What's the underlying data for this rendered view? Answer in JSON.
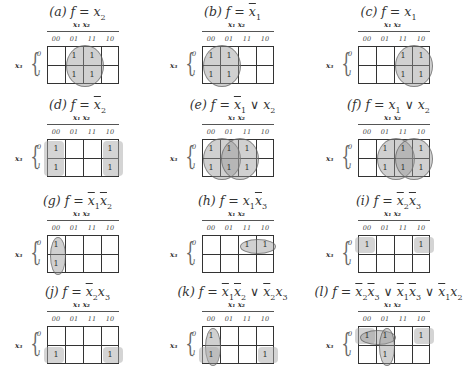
{
  "figure": {
    "column_variables": "x1 x2",
    "row_variable": "x3",
    "column_labels": [
      "00",
      "01",
      "11",
      "10"
    ],
    "row_labels": [
      "0",
      "1"
    ],
    "panels": [
      {
        "id": "a",
        "label": "(a)",
        "expr": "f = x2",
        "ones": [
          [
            0,
            1
          ],
          [
            0,
            2
          ],
          [
            1,
            1
          ],
          [
            1,
            2
          ]
        ],
        "groups": [
          {
            "shape": "circle",
            "cells": [
              [
                0,
                1
              ],
              [
                0,
                2
              ],
              [
                1,
                1
              ],
              [
                1,
                2
              ]
            ]
          }
        ]
      },
      {
        "id": "b",
        "label": "(b)",
        "expr": "f = x̄1",
        "ones": [
          [
            0,
            0
          ],
          [
            0,
            1
          ],
          [
            1,
            0
          ],
          [
            1,
            1
          ]
        ],
        "groups": [
          {
            "shape": "circle",
            "cells": [
              [
                0,
                0
              ],
              [
                0,
                1
              ],
              [
                1,
                0
              ],
              [
                1,
                1
              ]
            ]
          }
        ]
      },
      {
        "id": "c",
        "label": "(c)",
        "expr": "f = x1",
        "ones": [
          [
            0,
            2
          ],
          [
            0,
            3
          ],
          [
            1,
            2
          ],
          [
            1,
            3
          ]
        ],
        "groups": [
          {
            "shape": "circle",
            "cells": [
              [
                0,
                2
              ],
              [
                0,
                3
              ],
              [
                1,
                2
              ],
              [
                1,
                3
              ]
            ]
          }
        ]
      },
      {
        "id": "d",
        "label": "(d)",
        "expr": "f = x̄2",
        "ones": [
          [
            0,
            0
          ],
          [
            0,
            3
          ],
          [
            1,
            0
          ],
          [
            1,
            3
          ]
        ],
        "groups": [
          {
            "shape": "wrap-box",
            "cells": [
              [
                0,
                0
              ],
              [
                1,
                0
              ],
              [
                0,
                3
              ],
              [
                1,
                3
              ]
            ]
          }
        ]
      },
      {
        "id": "e",
        "label": "(e)",
        "expr": "f = x̄1 ∨ x2",
        "ones": [
          [
            0,
            0
          ],
          [
            0,
            1
          ],
          [
            0,
            2
          ],
          [
            1,
            0
          ],
          [
            1,
            1
          ],
          [
            1,
            2
          ]
        ],
        "groups": [
          {
            "shape": "circle",
            "cells": [
              [
                0,
                0
              ],
              [
                0,
                1
              ],
              [
                1,
                0
              ],
              [
                1,
                1
              ]
            ]
          },
          {
            "shape": "circle",
            "cells": [
              [
                0,
                1
              ],
              [
                0,
                2
              ],
              [
                1,
                1
              ],
              [
                1,
                2
              ]
            ]
          }
        ]
      },
      {
        "id": "f",
        "label": "(f)",
        "expr": "f = x1 ∨ x2",
        "ones": [
          [
            0,
            1
          ],
          [
            0,
            2
          ],
          [
            0,
            3
          ],
          [
            1,
            1
          ],
          [
            1,
            2
          ],
          [
            1,
            3
          ]
        ],
        "groups": [
          {
            "shape": "circle",
            "cells": [
              [
                0,
                1
              ],
              [
                0,
                2
              ],
              [
                1,
                1
              ],
              [
                1,
                2
              ]
            ]
          },
          {
            "shape": "circle",
            "cells": [
              [
                0,
                2
              ],
              [
                0,
                3
              ],
              [
                1,
                2
              ],
              [
                1,
                3
              ]
            ]
          }
        ]
      },
      {
        "id": "g",
        "label": "(g)",
        "expr": "f = x̄1x̄2",
        "ones": [
          [
            0,
            0
          ],
          [
            1,
            0
          ]
        ],
        "groups": [
          {
            "shape": "ellipse-vertical",
            "cells": [
              [
                0,
                0
              ],
              [
                1,
                0
              ]
            ]
          }
        ]
      },
      {
        "id": "h",
        "label": "(h)",
        "expr": "f = x1x̄3",
        "ones": [
          [
            0,
            2
          ],
          [
            0,
            3
          ]
        ],
        "groups": [
          {
            "shape": "ellipse-horizontal",
            "cells": [
              [
                0,
                2
              ],
              [
                0,
                3
              ]
            ]
          }
        ]
      },
      {
        "id": "i",
        "label": "(i)",
        "expr": "f = x̄2x̄3",
        "ones": [
          [
            0,
            0
          ],
          [
            0,
            3
          ]
        ],
        "groups": [
          {
            "shape": "wrap-box",
            "cells": [
              [
                0,
                0
              ],
              [
                0,
                3
              ]
            ]
          }
        ]
      },
      {
        "id": "j",
        "label": "(j)",
        "expr": "f = x̄2x3",
        "ones": [
          [
            1,
            0
          ],
          [
            1,
            3
          ]
        ],
        "groups": [
          {
            "shape": "wrap-box",
            "cells": [
              [
                1,
                0
              ],
              [
                1,
                3
              ]
            ]
          }
        ]
      },
      {
        "id": "k",
        "label": "(k)",
        "expr": "f = x̄1x̄2 ∨ x̄2x3",
        "ones": [
          [
            0,
            0
          ],
          [
            1,
            0
          ],
          [
            1,
            3
          ]
        ],
        "groups": [
          {
            "shape": "ellipse-vertical",
            "cells": [
              [
                0,
                0
              ],
              [
                1,
                0
              ]
            ]
          },
          {
            "shape": "wrap-box",
            "cells": [
              [
                1,
                0
              ],
              [
                1,
                3
              ]
            ]
          }
        ]
      },
      {
        "id": "l",
        "label": "(l)",
        "expr": "f = x̄2x̄3 ∨ x̄1x̄3 ∨ x̄1x2",
        "ones": [
          [
            0,
            0
          ],
          [
            0,
            1
          ],
          [
            0,
            3
          ],
          [
            1,
            1
          ]
        ],
        "groups": [
          {
            "shape": "wrap-box",
            "cells": [
              [
                0,
                0
              ],
              [
                0,
                3
              ]
            ]
          },
          {
            "shape": "ellipse-horizontal",
            "cells": [
              [
                0,
                0
              ],
              [
                0,
                1
              ]
            ]
          },
          {
            "shape": "ellipse-vertical",
            "cells": [
              [
                0,
                1
              ],
              [
                1,
                1
              ]
            ]
          }
        ]
      }
    ]
  },
  "text": {
    "cell_one": "1",
    "col_00": "00",
    "col_01": "01",
    "col_11": "11",
    "col_10": "10",
    "row_0": "0",
    "row_1": "1",
    "colvars": "x₁ x₂",
    "rowvar": "x₃",
    "brace": "{"
  }
}
